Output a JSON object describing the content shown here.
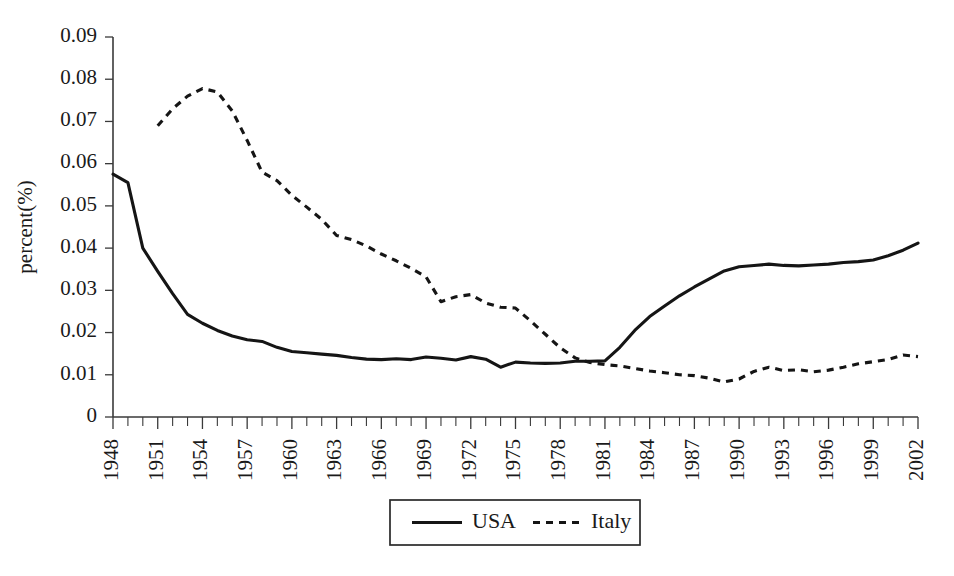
{
  "chart_data": {
    "type": "line",
    "title": "",
    "xlabel": "",
    "ylabel": "percent(%)",
    "ylim": [
      0,
      0.09
    ],
    "xlim": [
      1948,
      2002
    ],
    "grid": false,
    "legend_position": "bottom-center",
    "y_ticks": [
      "0",
      "0.01",
      "0.02",
      "0.03",
      "0.04",
      "0.05",
      "0.06",
      "0.07",
      "0.08",
      "0.09"
    ],
    "y_tick_values": [
      0,
      0.01,
      0.02,
      0.03,
      0.04,
      0.05,
      0.06,
      0.07,
      0.08,
      0.09
    ],
    "x_tick_labels": [
      "1948",
      "1951",
      "1954",
      "1957",
      "1960",
      "1963",
      "1966",
      "1969",
      "1972",
      "1975",
      "1978",
      "1981",
      "1984",
      "1987",
      "1990",
      "1993",
      "1996",
      "1999",
      "2002"
    ],
    "x_tick_label_values": [
      1948,
      1951,
      1954,
      1957,
      1960,
      1963,
      1966,
      1969,
      1972,
      1975,
      1978,
      1981,
      1984,
      1987,
      1990,
      1993,
      1996,
      1999,
      2002
    ],
    "x_minor_ticks_every": 1,
    "x": [
      1948,
      1949,
      1950,
      1951,
      1952,
      1953,
      1954,
      1955,
      1956,
      1957,
      1958,
      1959,
      1960,
      1961,
      1962,
      1963,
      1964,
      1965,
      1966,
      1967,
      1968,
      1969,
      1970,
      1971,
      1972,
      1973,
      1974,
      1975,
      1976,
      1977,
      1978,
      1979,
      1980,
      1981,
      1982,
      1983,
      1984,
      1985,
      1986,
      1987,
      1988,
      1989,
      1990,
      1991,
      1992,
      1993,
      1994,
      1995,
      1996,
      1997,
      1998,
      1999,
      2000,
      2001,
      2002
    ],
    "series": [
      {
        "name": "USA",
        "style": "solid",
        "color": "#151515",
        "x": [
          1948,
          1949,
          1950,
          1951,
          1952,
          1953,
          1954,
          1955,
          1956,
          1957,
          1958,
          1959,
          1960,
          1961,
          1962,
          1963,
          1964,
          1965,
          1966,
          1967,
          1968,
          1969,
          1970,
          1971,
          1972,
          1973,
          1974,
          1975,
          1976,
          1977,
          1978,
          1979,
          1980,
          1981,
          1982,
          1983,
          1984,
          1985,
          1986,
          1987,
          1988,
          1989,
          1990,
          1991,
          1992,
          1993,
          1994,
          1995,
          1996,
          1997,
          1998,
          1999,
          2000,
          2001,
          2002
        ],
        "values": [
          0.0575,
          0.0555,
          0.04,
          0.0345,
          0.0292,
          0.0243,
          0.0222,
          0.0205,
          0.0192,
          0.0183,
          0.0179,
          0.0165,
          0.0155,
          0.0152,
          0.0149,
          0.0146,
          0.0141,
          0.0137,
          0.0136,
          0.0138,
          0.0136,
          0.0142,
          0.0139,
          0.0135,
          0.0143,
          0.0137,
          0.0118,
          0.013,
          0.0128,
          0.0127,
          0.0128,
          0.0132,
          0.0132,
          0.0133,
          0.0165,
          0.0205,
          0.0238,
          0.0263,
          0.0287,
          0.0308,
          0.0327,
          0.0346,
          0.0356,
          0.0359,
          0.0362,
          0.0359,
          0.0358,
          0.036,
          0.0362,
          0.0366,
          0.0368,
          0.0372,
          0.0382,
          0.0395,
          0.0412
        ]
      },
      {
        "name": "Italy",
        "style": "dashed",
        "color": "#151515",
        "x": [
          1951,
          1952,
          1953,
          1954,
          1955,
          1956,
          1957,
          1958,
          1959,
          1960,
          1961,
          1962,
          1963,
          1964,
          1965,
          1966,
          1967,
          1968,
          1969,
          1970,
          1971,
          1972,
          1973,
          1974,
          1975,
          1976,
          1977,
          1978,
          1979,
          1980,
          1981,
          1982,
          1983,
          1984,
          1985,
          1986,
          1987,
          1988,
          1989,
          1990,
          1991,
          1992,
          1993,
          1994,
          1995,
          1996,
          1997,
          1998,
          1999,
          2000,
          2001,
          2002
        ],
        "values": [
          0.069,
          0.073,
          0.076,
          0.0778,
          0.077,
          0.0725,
          0.0655,
          0.058,
          0.056,
          0.0525,
          0.0497,
          0.0468,
          0.043,
          0.042,
          0.0405,
          0.0386,
          0.037,
          0.0352,
          0.0332,
          0.0273,
          0.0285,
          0.029,
          0.027,
          0.026,
          0.0258,
          0.0228,
          0.0196,
          0.0164,
          0.014,
          0.0129,
          0.0124,
          0.0121,
          0.0115,
          0.0109,
          0.0105,
          0.01,
          0.0098,
          0.0092,
          0.0083,
          0.009,
          0.0108,
          0.0118,
          0.011,
          0.0112,
          0.0107,
          0.0111,
          0.0118,
          0.0126,
          0.0131,
          0.0136,
          0.0147,
          0.0143
        ]
      }
    ],
    "legend": [
      {
        "label": "USA",
        "style": "solid"
      },
      {
        "label": "Italy",
        "style": "dashed"
      }
    ]
  }
}
